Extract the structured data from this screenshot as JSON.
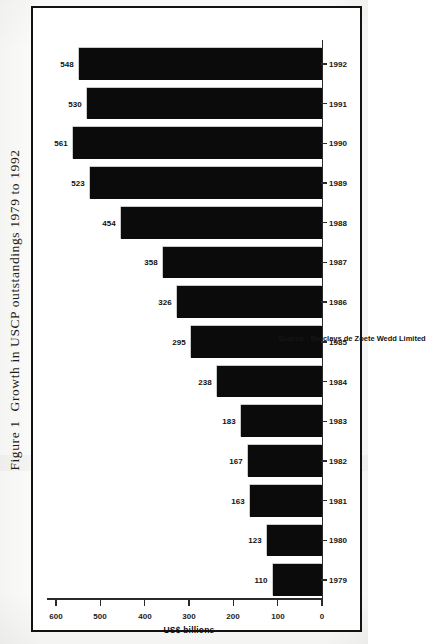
{
  "figure": {
    "number": "Figure 1",
    "caption": "Growth in USCP outstandings 1979 to 1992"
  },
  "source_note": "Source : Barclays de Zoete Wedd Limited",
  "chart_data": {
    "type": "bar",
    "orientation": "horizontal-rotated",
    "xlabel": "",
    "ylabel": "US$ billions",
    "ylim": [
      0,
      600
    ],
    "grid": false,
    "legend": "none",
    "tick_labels": [
      "0",
      "100",
      "200",
      "300",
      "400",
      "500",
      "600"
    ],
    "ticks": [
      0,
      100,
      200,
      300,
      400,
      500,
      600
    ],
    "categories": [
      "1979",
      "1980",
      "1981",
      "1982",
      "1983",
      "1984",
      "1985",
      "1986",
      "1987",
      "1988",
      "1989",
      "1990",
      "1991",
      "1992"
    ],
    "values": [
      110,
      123,
      163,
      167,
      183,
      238,
      295,
      326,
      358,
      454,
      523,
      561,
      530,
      548
    ],
    "value_labels": [
      "110",
      "123",
      "163",
      "167",
      "183",
      "238",
      "295",
      "326",
      "358",
      "454",
      "523",
      "561",
      "530",
      "548"
    ],
    "bar_color": "#0b0b0b",
    "axis_color": "#2a2a2a",
    "background": "#ffffff"
  }
}
